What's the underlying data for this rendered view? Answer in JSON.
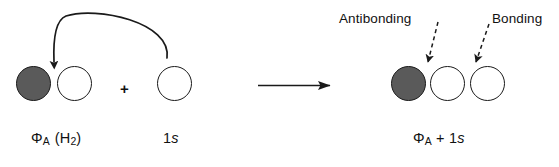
{
  "figure": {
    "background_color": "#ffffff",
    "stroke_color": "#1a1a1a",
    "filled_lobe_color": "#5a5a5a",
    "hollow_lobe_color": "#ffffff"
  },
  "left_group": {
    "name": "reactant-phi-a-h2",
    "label_phi": "Φ",
    "label_phi_sub": "A",
    "label_paren": "(H",
    "label_paren_sub": "2",
    "label_paren_close": ")",
    "label_full": "ΦA (H2)",
    "lobes": [
      {
        "fill": "filled",
        "name": "lobe-phi-a-left"
      },
      {
        "fill": "hollow",
        "name": "lobe-phi-a-right"
      }
    ]
  },
  "plus_sign": {
    "name": "plus-operator",
    "text": "+"
  },
  "s_orbital": {
    "name": "reactant-1s",
    "label_number": "1",
    "label_letter": "s",
    "label_full": "1s"
  },
  "curved_arrow": {
    "name": "electron-flow-arrow",
    "description": "curved arrow from 1s orbital to the node between phi-A lobes",
    "direction": "right-to-left"
  },
  "reaction_arrow": {
    "name": "reaction-arrow",
    "description": "straight reaction arrow pointing right"
  },
  "right_group": {
    "name": "product-phi-a-plus-1s",
    "label_phi": "Φ",
    "label_phi_sub": "A",
    "label_plus": "+",
    "label_number": "1",
    "label_letter": "s",
    "label_full": "ΦA + 1s",
    "lobes": [
      {
        "fill": "filled",
        "name": "lobe-product-1"
      },
      {
        "fill": "hollow",
        "name": "lobe-product-2"
      },
      {
        "fill": "hollow",
        "name": "lobe-product-3"
      }
    ]
  },
  "annotations": [
    {
      "name": "antibonding-label",
      "text": "Antibonding",
      "pointer": "dashed-arrow pointing to interface between lobe 1 and lobe 2"
    },
    {
      "name": "bonding-label",
      "text": "Bonding",
      "pointer": "dashed-arrow pointing to interface between lobe 2 and lobe 3"
    }
  ]
}
